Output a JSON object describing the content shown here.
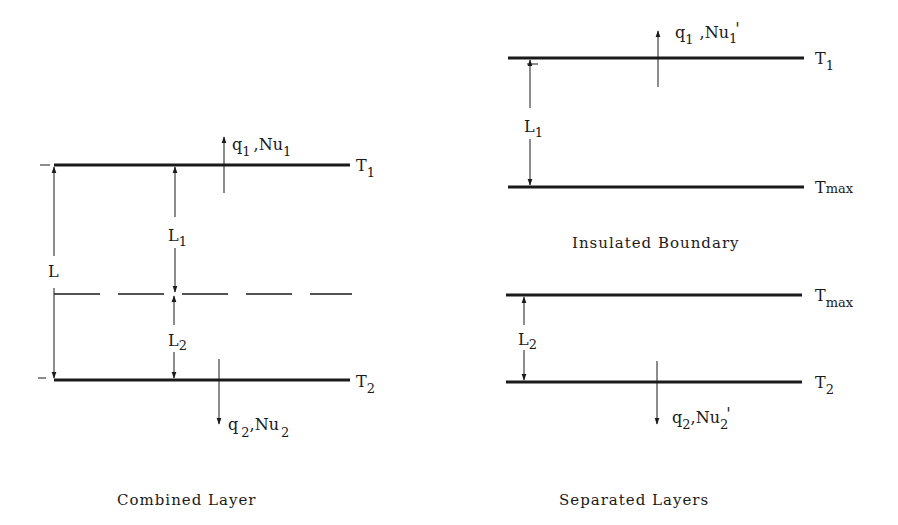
{
  "combined": {
    "caption": "Combined Layer",
    "top_temp": {
      "base": "T",
      "sub": "1"
    },
    "bottom_temp": {
      "base": "T",
      "sub": "2"
    },
    "L": "L",
    "L1": {
      "base": "L",
      "sub": "1"
    },
    "L2": {
      "base": "L",
      "sub": "2"
    },
    "q_top": {
      "q": "q",
      "q_sub": "1",
      "sep": ",",
      "nu": "Nu",
      "nu_sub": "1"
    },
    "q_bottom": {
      "q": "q",
      "q_sub": "2",
      "sep": ",",
      "nu": "Nu",
      "nu_sub": "2"
    }
  },
  "separated": {
    "caption": "Separated Layers",
    "boundary_label": "Insulated Boundary",
    "top_layer": {
      "top_temp": {
        "base": "T",
        "sub": "1"
      },
      "bottom_temp": {
        "base": "T",
        "sub": "max"
      },
      "L1": {
        "base": "L",
        "sub": "1"
      },
      "q": {
        "q": "q",
        "q_sub": "1",
        "sep": ",",
        "nu": "Nu",
        "nu_sub": "1",
        "prime": "'"
      }
    },
    "bottom_layer": {
      "top_temp": {
        "base": "T",
        "sub": "max"
      },
      "bottom_temp": {
        "base": "T",
        "sub": "2"
      },
      "L2": {
        "base": "L",
        "sub": "2"
      },
      "q": {
        "q": "q",
        "q_sub": "2",
        "sep": ",",
        "nu": "Nu",
        "nu_sub": "2",
        "prime": "'"
      }
    }
  },
  "colors": {
    "line": "#1a1a1a",
    "background": "#ffffff"
  }
}
